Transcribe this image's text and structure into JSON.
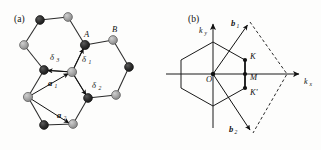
{
  "figure": {
    "panels": [
      {
        "id": "a",
        "label": "(a)"
      },
      {
        "id": "b",
        "label": "(b)"
      }
    ]
  },
  "panel_a": {
    "label": "(a)",
    "description": "Honeycomb (graphene) real-space lattice with A and B sublattices, nearest-neighbour vectors delta1, delta2, delta3 and primitive lattice vectors a1, a2",
    "colors": {
      "sublattice_a": "#232323",
      "sublattice_b": "#9a9a9a",
      "bond": "#2a2a2a",
      "outline": "#111111"
    },
    "atom_labels": [
      {
        "name": "A",
        "text": "A",
        "sublattice": "A",
        "x": 84,
        "y": 37
      },
      {
        "name": "B",
        "text": "B",
        "sublattice": "B",
        "x": 112,
        "y": 32
      }
    ],
    "delta_vectors": [
      {
        "name": "delta-1",
        "symbol": "δ",
        "sub": "1",
        "x": 82,
        "y": 62
      },
      {
        "name": "delta-2",
        "symbol": "δ",
        "sub": "2",
        "x": 92,
        "y": 88
      },
      {
        "name": "delta-3",
        "symbol": "δ",
        "sub": "3",
        "x": 50,
        "y": 60
      }
    ],
    "lattice_vectors": [
      {
        "name": "a-1",
        "symbol": "a",
        "sub": "1",
        "x": 48,
        "y": 86
      },
      {
        "name": "a-2",
        "symbol": "a",
        "sub": "2",
        "x": 57,
        "y": 118
      }
    ],
    "atoms": [
      {
        "sub": "A",
        "x": 40,
        "y": 20
      },
      {
        "sub": "B",
        "x": 68,
        "y": 17
      },
      {
        "sub": "B",
        "x": 24,
        "y": 45
      },
      {
        "sub": "A",
        "x": 85,
        "y": 45
      },
      {
        "sub": "B",
        "x": 113,
        "y": 40
      },
      {
        "sub": "A",
        "x": 44,
        "y": 70
      },
      {
        "sub": "B",
        "x": 72,
        "y": 72
      },
      {
        "sub": "A",
        "x": 129,
        "y": 67
      },
      {
        "sub": "B",
        "x": 28,
        "y": 97
      },
      {
        "sub": "A",
        "x": 88,
        "y": 98
      },
      {
        "sub": "B",
        "x": 116,
        "y": 95
      },
      {
        "sub": "A",
        "x": 44,
        "y": 125
      },
      {
        "sub": "B",
        "x": 73,
        "y": 124
      }
    ]
  },
  "panel_b": {
    "label": "(b)",
    "description": "Reciprocal space: first Brillouin zone hexagon with high-symmetry points K, M, K-prime, reciprocal lattice vectors b1 and b2, and dashed primitive cell",
    "colors": {
      "hexagon": "#1a1a1a",
      "axis": "#1a1a1a",
      "dashed": "#2a2a2a",
      "point": "#111111"
    },
    "origin": {
      "name": "O",
      "text": "O",
      "x": 206,
      "y": 82
    },
    "axes": [
      {
        "name": "kx-axis",
        "symbol": "k",
        "sub": "x",
        "x": 304,
        "y": 84
      },
      {
        "name": "ky-axis",
        "symbol": "k",
        "sub": "y",
        "x": 205,
        "y": 29
      }
    ],
    "reciprocal_vectors": [
      {
        "name": "b-1",
        "symbol": "b",
        "sub": "1",
        "x": 231,
        "y": 26
      },
      {
        "name": "b-2",
        "symbol": "b",
        "sub": "2",
        "x": 229,
        "y": 132
      }
    ],
    "symmetry_points": [
      {
        "name": "K",
        "text": "K",
        "px": 245,
        "py": 60,
        "lx": 250,
        "ly": 59
      },
      {
        "name": "M",
        "text": "M",
        "px": 245,
        "py": 74,
        "lx": 250,
        "ly": 80
      },
      {
        "name": "K-prime",
        "text": "K'",
        "px": 245,
        "py": 88,
        "lx": 250,
        "ly": 95
      }
    ]
  }
}
